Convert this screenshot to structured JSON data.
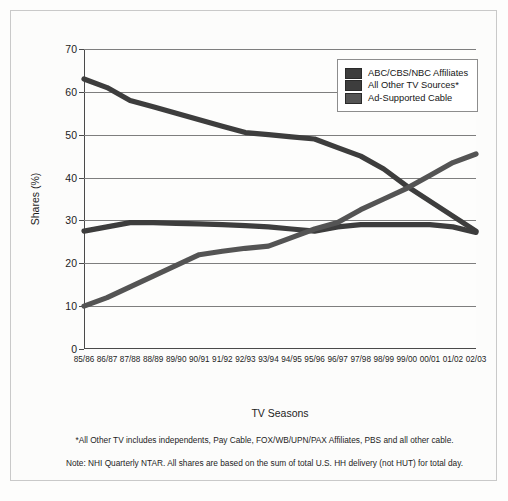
{
  "chart_data": {
    "type": "line",
    "title": "",
    "xlabel": "TV Seasons",
    "ylabel": "Shares (%)",
    "ylim": [
      0,
      70
    ],
    "yticks": [
      0,
      10,
      20,
      30,
      40,
      50,
      60,
      70
    ],
    "grid": true,
    "legend_position": "top-right",
    "categories": [
      "85/86",
      "86/87",
      "87/88",
      "88/89",
      "89/90",
      "90/91",
      "91/92",
      "92/93",
      "93/94",
      "94/95",
      "95/96",
      "96/97",
      "97/98",
      "98/99",
      "99/00",
      "00/01",
      "01/02",
      "02/03"
    ],
    "series": [
      {
        "name": "ABC/CBS/NBC Affiliates",
        "color": "#3d3d3d",
        "values": [
          63,
          61,
          58,
          56.5,
          55,
          53.5,
          52,
          50.5,
          50,
          49.5,
          49,
          47,
          45,
          42,
          38,
          34.5,
          31,
          27.5
        ]
      },
      {
        "name": "All Other TV Sources*",
        "color": "#3d3d3d",
        "values": [
          27.5,
          28.5,
          29.5,
          29.5,
          29.3,
          29.2,
          29,
          28.8,
          28.5,
          28,
          27.5,
          28.5,
          29,
          29,
          29,
          29,
          28.5,
          27.2
        ]
      },
      {
        "name": "Ad-Supported Cable",
        "color": "#545454",
        "values": [
          10,
          12,
          14.5,
          17,
          19.5,
          22,
          22.8,
          23.5,
          24,
          26,
          28,
          29.5,
          32.5,
          35,
          37.5,
          40.5,
          43.5,
          45.5
        ]
      }
    ]
  },
  "legend": {
    "items": [
      {
        "label": "ABC/CBS/NBC Affiliates",
        "color": "#3d3d3d"
      },
      {
        "label": "All Other TV Sources*",
        "color": "#3d3d3d"
      },
      {
        "label": "Ad-Supported Cable",
        "color": "#545454"
      }
    ]
  },
  "notes": [
    "*All Other TV includes independents, Pay Cable, FOX/WB/UPN/PAX Affiliates, PBS and all other cable.",
    "Note: NHI Quarterly NTAR. All shares are based on the sum of total U.S. HH delivery (not HUT) for total day."
  ]
}
